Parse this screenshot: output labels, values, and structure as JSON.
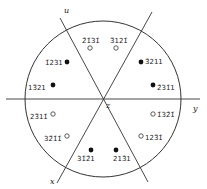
{
  "diagram": {
    "type": "stereographic-projection",
    "axes": {
      "u": "u",
      "x": "x",
      "y": "y",
      "z": "z"
    },
    "poles_filled": [
      {
        "label": "1̄231",
        "note": "upper-left"
      },
      {
        "label": "13̄21",
        "note": "left"
      },
      {
        "label": "3̄211",
        "note": "upper-right"
      },
      {
        "label": "2̄31̄1",
        "note": "right"
      },
      {
        "label": "31̄2̄1",
        "note": "lower-left"
      },
      {
        "label": "213̄1",
        "note": "lower-right"
      }
    ],
    "poles_open": [
      {
        "label": "2̄1̄31̄",
        "note": "top-left"
      },
      {
        "label": "3̄121̄",
        "note": "top-right"
      },
      {
        "label": "23̄11̄",
        "note": "left-lower"
      },
      {
        "label": "32̄1̄1̄",
        "note": "lower-left"
      },
      {
        "label": "1̄32̄1̄",
        "note": "right-lower"
      },
      {
        "label": "123̄1̄",
        "note": "lower-right"
      }
    ],
    "colors": {
      "line": "#333333",
      "background": "#ffffff"
    }
  }
}
